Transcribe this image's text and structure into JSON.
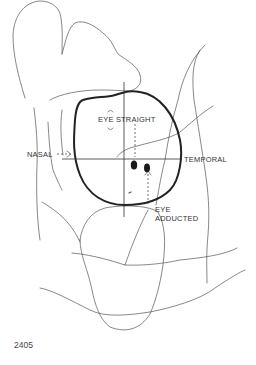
{
  "figure": {
    "number": "2405",
    "labels": {
      "eye_straight": "EYE STRAIGHT",
      "nasal": "NASAL",
      "temporal": "TEMPORAL",
      "eye_adducted_line1": "EYE",
      "eye_adducted_line2": "ADDUCTED"
    },
    "colors": {
      "line": "#555555",
      "outline": "#222222",
      "background": "#ffffff"
    }
  }
}
